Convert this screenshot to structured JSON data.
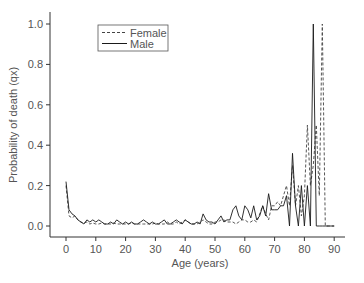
{
  "chart_data": {
    "type": "line",
    "title": "",
    "xlabel": "Age (years)",
    "ylabel": "Probability of death (qx)",
    "xlim": [
      -5,
      95
    ],
    "ylim": [
      -0.04,
      1.05
    ],
    "xticks": [
      0,
      10,
      20,
      30,
      40,
      50,
      60,
      70,
      80,
      90
    ],
    "yticks": [
      0.0,
      0.2,
      0.4,
      0.6,
      0.8,
      1.0
    ],
    "ytick_labels": [
      "0.0",
      "0.2",
      "0.4",
      "0.6",
      "0.8",
      "1.0"
    ],
    "grid": false,
    "legend_position": "upper left (inside plot)",
    "series": [
      {
        "name": "Female",
        "style": "dashed",
        "x": [
          0,
          1,
          2,
          3,
          4,
          5,
          6,
          7,
          8,
          9,
          10,
          11,
          12,
          13,
          14,
          15,
          16,
          17,
          18,
          19,
          20,
          21,
          22,
          23,
          24,
          25,
          26,
          27,
          28,
          29,
          30,
          31,
          32,
          33,
          34,
          35,
          36,
          37,
          38,
          39,
          40,
          41,
          42,
          43,
          44,
          45,
          46,
          47,
          48,
          49,
          50,
          51,
          52,
          53,
          54,
          55,
          56,
          57,
          58,
          59,
          60,
          61,
          62,
          63,
          64,
          65,
          66,
          67,
          68,
          69,
          70,
          71,
          72,
          73,
          74,
          75,
          76,
          77,
          78,
          79,
          80,
          81,
          82,
          83,
          84,
          85,
          86,
          87,
          88,
          89,
          90
        ],
        "y": [
          0.2,
          0.05,
          0.04,
          0.05,
          0.03,
          0.02,
          0.015,
          0.02,
          0.01,
          0.015,
          0.01,
          0.01,
          0.015,
          0.01,
          0.01,
          0.01,
          0.015,
          0.01,
          0.01,
          0.01,
          0.01,
          0.01,
          0.015,
          0.01,
          0.01,
          0.01,
          0.01,
          0.01,
          0.01,
          0.01,
          0.015,
          0.01,
          0.01,
          0.01,
          0.02,
          0.01,
          0.01,
          0.02,
          0.01,
          0.02,
          0.03,
          0.02,
          0.01,
          0.01,
          0.01,
          0.02,
          0.03,
          0.02,
          0.01,
          0.01,
          0.02,
          0.02,
          0.03,
          0.03,
          0.02,
          0.02,
          0.02,
          0.01,
          0.02,
          0.03,
          0.03,
          0.02,
          0.02,
          0.03,
          0.02,
          0.06,
          0.1,
          0.06,
          0.03,
          0.1,
          0.1,
          0.12,
          0.1,
          0.15,
          0.2,
          0.1,
          0.3,
          0.1,
          0.2,
          0.05,
          0.15,
          0.5,
          0.2,
          0.3,
          0.5,
          0.15,
          1.0,
          0.0,
          0.0,
          0.0,
          0.0
        ]
      },
      {
        "name": "Male",
        "style": "solid",
        "x": [
          0,
          1,
          2,
          3,
          4,
          5,
          6,
          7,
          8,
          9,
          10,
          11,
          12,
          13,
          14,
          15,
          16,
          17,
          18,
          19,
          20,
          21,
          22,
          23,
          24,
          25,
          26,
          27,
          28,
          29,
          30,
          31,
          32,
          33,
          34,
          35,
          36,
          37,
          38,
          39,
          40,
          41,
          42,
          43,
          44,
          45,
          46,
          47,
          48,
          49,
          50,
          51,
          52,
          53,
          54,
          55,
          56,
          57,
          58,
          59,
          60,
          61,
          62,
          63,
          64,
          65,
          66,
          67,
          68,
          69,
          70,
          71,
          72,
          73,
          74,
          75,
          76,
          77,
          78,
          79,
          80,
          81,
          82,
          83,
          84,
          85,
          86,
          87,
          88,
          89,
          90
        ],
        "y": [
          0.22,
          0.08,
          0.06,
          0.05,
          0.03,
          0.02,
          0.01,
          0.03,
          0.02,
          0.03,
          0.02,
          0.03,
          0.02,
          0.01,
          0.01,
          0.02,
          0.01,
          0.03,
          0.02,
          0.01,
          0.02,
          0.01,
          0.02,
          0.01,
          0.01,
          0.02,
          0.03,
          0.02,
          0.01,
          0.02,
          0.01,
          0.01,
          0.02,
          0.03,
          0.01,
          0.01,
          0.02,
          0.03,
          0.02,
          0.01,
          0.03,
          0.02,
          0.01,
          0.01,
          0.02,
          0.01,
          0.06,
          0.03,
          0.02,
          0.02,
          0.01,
          0.03,
          0.05,
          0.02,
          0.03,
          0.03,
          0.08,
          0.1,
          0.05,
          0.03,
          0.1,
          0.08,
          0.04,
          0.1,
          0.03,
          0.05,
          0.1,
          0.05,
          0.16,
          0.08,
          0.08,
          0.08,
          0.1,
          0.1,
          0.15,
          0.0,
          0.36,
          0.1,
          0.0,
          0.2,
          0.0,
          0.2,
          0.0,
          1.0,
          0.0,
          0.0,
          0.0,
          0.0,
          0.0,
          0.0,
          0.0
        ]
      }
    ]
  },
  "legend": {
    "items": [
      {
        "label": "Female",
        "style": "dashed"
      },
      {
        "label": "Male",
        "style": "solid"
      }
    ]
  },
  "axes": {
    "xlabel": "Age (years)",
    "ylabel": "Probability of death (qx)",
    "xtick_labels": [
      "0",
      "10",
      "20",
      "30",
      "40",
      "50",
      "60",
      "70",
      "80",
      "90"
    ],
    "ytick_labels": [
      "0.0",
      "0.2",
      "0.4",
      "0.6",
      "0.8",
      "1.0"
    ]
  },
  "colors": {
    "female_line": "#444444",
    "male_line": "#1a1a1a",
    "axis": "#333333",
    "text": "#555555"
  }
}
